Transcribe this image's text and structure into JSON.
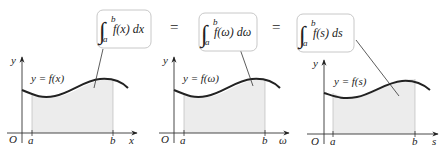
{
  "equals_sign": "=",
  "panels": [
    {
      "variable": "x",
      "integral": {
        "sign": "∫",
        "lower": "a",
        "upper": "b",
        "integrand": "f(x) dx"
      },
      "curve_label": "y = f(x)",
      "axis_labels": {
        "origin": "O",
        "y": "y",
        "x": "x",
        "a": "a",
        "b": "b"
      }
    },
    {
      "variable": "ω",
      "integral": {
        "sign": "∫",
        "lower": "a",
        "upper": "b",
        "integrand": "f(ω) dω"
      },
      "curve_label": "y = f(ω)",
      "axis_labels": {
        "origin": "O",
        "y": "y",
        "x": "ω",
        "a": "a",
        "b": "b"
      }
    },
    {
      "variable": "s",
      "integral": {
        "sign": "∫",
        "lower": "a",
        "upper": "b",
        "integrand": "f(s) ds"
      },
      "curve_label": "y = f(s)",
      "axis_labels": {
        "origin": "O",
        "y": "y",
        "x": "s",
        "a": "a",
        "b": "b"
      }
    }
  ],
  "colors": {
    "curve": "#222222",
    "fill": "#ececec",
    "box_border": "#c8c8c8",
    "axis": "#333333",
    "leader": "#333333"
  }
}
